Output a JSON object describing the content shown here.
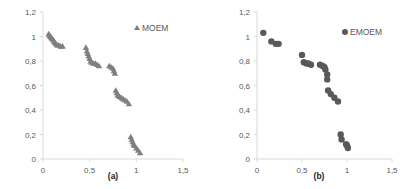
{
  "chart_data": [
    {
      "type": "scatter",
      "panel_label": "(a)",
      "legend": "MOEM",
      "marker": "triangle",
      "color": "#7f7f7f",
      "xlim": [
        0,
        1.5
      ],
      "ylim": [
        0,
        1.2
      ],
      "x_ticks": [
        "0",
        "0,5",
        "1",
        "1,5"
      ],
      "y_ticks": [
        "0",
        "0,2",
        "0,4",
        "0,6",
        "0,8",
        "1",
        "1,2"
      ],
      "xlabel": "",
      "ylabel": "",
      "grid": false,
      "legend_position": "top-right",
      "x": [
        0.06,
        0.07,
        0.08,
        0.09,
        0.1,
        0.11,
        0.12,
        0.13,
        0.14,
        0.15,
        0.17,
        0.19,
        0.21,
        0.46,
        0.47,
        0.48,
        0.49,
        0.5,
        0.51,
        0.52,
        0.54,
        0.56,
        0.58,
        0.6,
        0.71,
        0.73,
        0.75,
        0.76,
        0.77,
        0.78,
        0.79,
        0.8,
        0.82,
        0.84,
        0.86,
        0.88,
        0.9,
        0.92,
        0.94,
        0.95,
        0.96,
        0.97,
        0.98,
        1.0,
        1.02,
        1.04
      ],
      "y": [
        1.02,
        1.01,
        1.0,
        0.99,
        0.98,
        0.97,
        0.96,
        0.95,
        0.94,
        0.93,
        0.93,
        0.92,
        0.92,
        0.91,
        0.88,
        0.86,
        0.84,
        0.82,
        0.8,
        0.79,
        0.78,
        0.78,
        0.77,
        0.76,
        0.76,
        0.75,
        0.74,
        0.72,
        0.7,
        0.56,
        0.54,
        0.52,
        0.51,
        0.5,
        0.49,
        0.48,
        0.47,
        0.45,
        0.18,
        0.16,
        0.14,
        0.12,
        0.11,
        0.09,
        0.07,
        0.05
      ]
    },
    {
      "type": "scatter",
      "panel_label": "(b)",
      "legend": "EMOEM",
      "marker": "circle",
      "color": "#595959",
      "xlim": [
        0,
        1.5
      ],
      "ylim": [
        0,
        1.2
      ],
      "x_ticks": [
        "0",
        "0,5",
        "1",
        "1,5"
      ],
      "y_ticks": [
        "0",
        "0,2",
        "0,4",
        "0,6",
        "0,8",
        "1",
        "1,2"
      ],
      "xlabel": "",
      "ylabel": "",
      "grid": false,
      "legend_position": "top-right",
      "x": [
        0.07,
        0.16,
        0.21,
        0.24,
        0.5,
        0.52,
        0.55,
        0.57,
        0.6,
        0.7,
        0.73,
        0.75,
        0.76,
        0.78,
        0.78,
        0.79,
        0.82,
        0.86,
        0.9,
        0.93,
        0.94,
        0.99,
        1.0,
        1.01
      ],
      "y": [
        1.03,
        0.96,
        0.94,
        0.94,
        0.85,
        0.79,
        0.78,
        0.78,
        0.77,
        0.77,
        0.76,
        0.75,
        0.73,
        0.69,
        0.65,
        0.56,
        0.53,
        0.5,
        0.47,
        0.2,
        0.16,
        0.12,
        0.11,
        0.09
      ]
    }
  ]
}
